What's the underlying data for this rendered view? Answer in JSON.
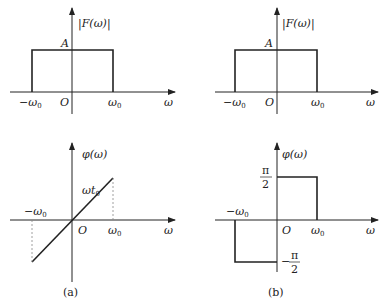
{
  "panels": {
    "a": {
      "caption": "(a)",
      "magnitude": {
        "ylabel": "|F(ω)|",
        "amplitude_label": "A",
        "xlabel": "ω",
        "origin_label": "O",
        "neg_cutoff": "−ω",
        "pos_cutoff": "ω",
        "cutoff_sub": "0"
      },
      "phase": {
        "ylabel": "φ(ω)",
        "slope_label": "ωt",
        "slope_sub": "0",
        "xlabel": "ω",
        "origin_label": "O",
        "neg_cutoff": "−ω",
        "pos_cutoff": "ω",
        "cutoff_sub": "0"
      }
    },
    "b": {
      "caption": "(b)",
      "magnitude": {
        "ylabel": "|F(ω)|",
        "amplitude_label": "A",
        "xlabel": "ω",
        "origin_label": "O",
        "neg_cutoff": "−ω",
        "pos_cutoff": "ω",
        "cutoff_sub": "0"
      },
      "phase": {
        "ylabel": "φ(ω)",
        "pos_level_num": "π",
        "pos_level_den": "2",
        "neg_level_sign": "−",
        "neg_level_num": "π",
        "neg_level_den": "2",
        "xlabel": "ω",
        "origin_label": "O",
        "neg_cutoff": "−ω",
        "pos_cutoff": "ω",
        "cutoff_sub": "0"
      }
    }
  },
  "colors": {
    "stroke": "#222222",
    "dashed": "#888888"
  }
}
